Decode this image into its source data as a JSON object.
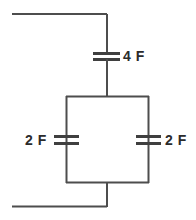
{
  "diagram": {
    "type": "circuit-schematic",
    "background_color": "#ffffff",
    "line_color": "#4d4d4d",
    "text_color": "#2b2b2b",
    "components": {
      "series_capacitor": {
        "label": "4 F",
        "value": 4,
        "unit": "F",
        "orientation": "horizontal-plates",
        "position": "top-branch"
      },
      "left_parallel_capacitor": {
        "label": "2 F",
        "value": 2,
        "unit": "F",
        "orientation": "horizontal-plates",
        "position": "left-branch"
      },
      "right_parallel_capacitor": {
        "label": "2 F",
        "value": 2,
        "unit": "F",
        "orientation": "horizontal-plates",
        "position": "right-branch"
      }
    },
    "wires": {
      "top_lead": "horizontal lead from left edge to top node",
      "bottom_lead": "horizontal lead from left edge to bottom node",
      "loop": "rectangular loop containing two parallel capacitors"
    }
  }
}
